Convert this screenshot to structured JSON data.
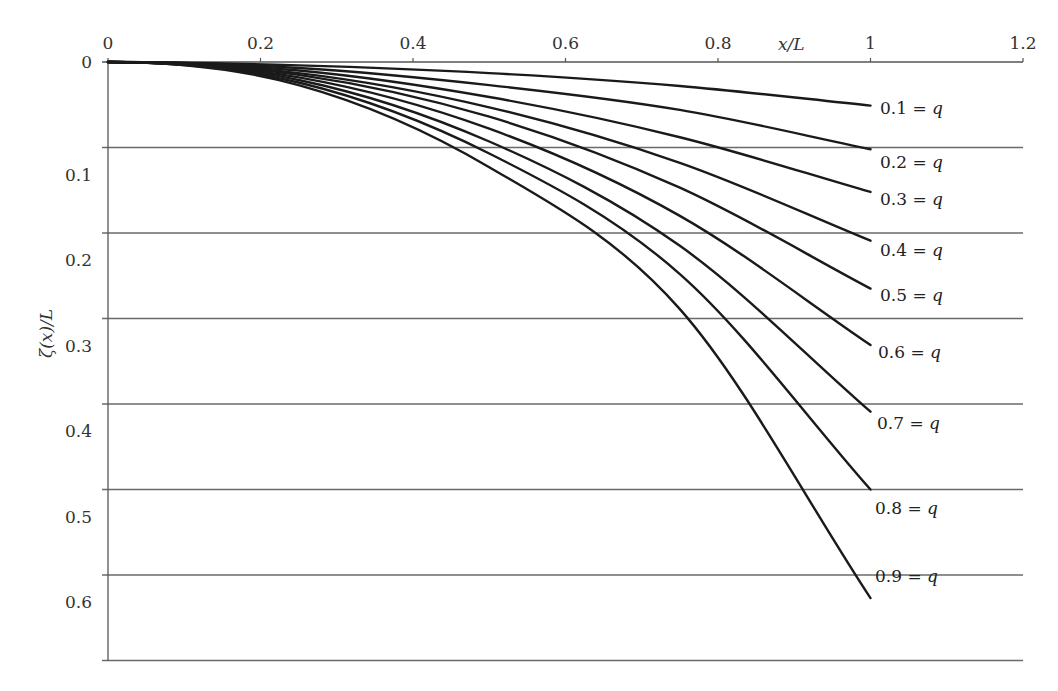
{
  "chart_data": {
    "type": "line",
    "title": "",
    "xlabel": "x/L",
    "ylabel": "ζ(x)/L",
    "x_axis_position": "top",
    "y_axis_inverted": true,
    "xlim": [
      0,
      1.2
    ],
    "ylim": [
      0,
      0.7
    ],
    "x_ticks": [
      0,
      0.2,
      0.4,
      0.6,
      0.8,
      1,
      1.2
    ],
    "x_tick_labels": [
      "0",
      "0.2",
      "0.4",
      "0.6",
      "0.8",
      "1",
      "1.2"
    ],
    "y_ticks": [
      0,
      0.1,
      0.2,
      0.3,
      0.4,
      0.5,
      0.6
    ],
    "y_tick_labels": [
      "0",
      "0.1",
      "0.2",
      "0.3",
      "0.4",
      "0.5",
      "0.6"
    ],
    "grid": {
      "horizontal": true,
      "vertical": false
    },
    "legend": "inline labels at curve ends",
    "x": [
      0,
      0.25,
      0.5,
      0.75,
      1.0
    ],
    "series": [
      {
        "name": "0.1 = q",
        "q": 0.1,
        "values": [
          0,
          0.004,
          0.013,
          0.028,
          0.051
        ]
      },
      {
        "name": "0.2 = q",
        "q": 0.2,
        "values": [
          0,
          0.007,
          0.027,
          0.056,
          0.102
        ]
      },
      {
        "name": "0.3 = q",
        "q": 0.3,
        "values": [
          0,
          0.01,
          0.041,
          0.088,
          0.152
        ]
      },
      {
        "name": "0.4 = q",
        "q": 0.4,
        "values": [
          0,
          0.013,
          0.053,
          0.118,
          0.209
        ]
      },
      {
        "name": "0.5 = q",
        "q": 0.5,
        "values": [
          0,
          0.015,
          0.064,
          0.147,
          0.265
        ]
      },
      {
        "name": "0.6 = q",
        "q": 0.6,
        "values": [
          0,
          0.018,
          0.078,
          0.18,
          0.331
        ]
      },
      {
        "name": "0.7 = q",
        "q": 0.7,
        "values": [
          0,
          0.021,
          0.093,
          0.215,
          0.409
        ]
      },
      {
        "name": "0.8 = q",
        "q": 0.8,
        "values": [
          0,
          0.024,
          0.107,
          0.248,
          0.5
        ]
      },
      {
        "name": "0.9 = q",
        "q": 0.9,
        "values": [
          0,
          0.027,
          0.123,
          0.289,
          0.627
        ]
      }
    ],
    "label_positions": [
      {
        "x_px": 880,
        "y_px": 114
      },
      {
        "x_px": 880,
        "y_px": 168
      },
      {
        "x_px": 880,
        "y_px": 205
      },
      {
        "x_px": 880,
        "y_px": 256
      },
      {
        "x_px": 880,
        "y_px": 301
      },
      {
        "x_px": 878,
        "y_px": 358
      },
      {
        "x_px": 877,
        "y_px": 429
      },
      {
        "x_px": 875,
        "y_px": 514
      },
      {
        "x_px": 875,
        "y_px": 582
      }
    ]
  },
  "colors": {
    "curve": "#1a1a1a",
    "grid": "#6a6a6a",
    "axis": "#555555",
    "text": "#333333"
  }
}
